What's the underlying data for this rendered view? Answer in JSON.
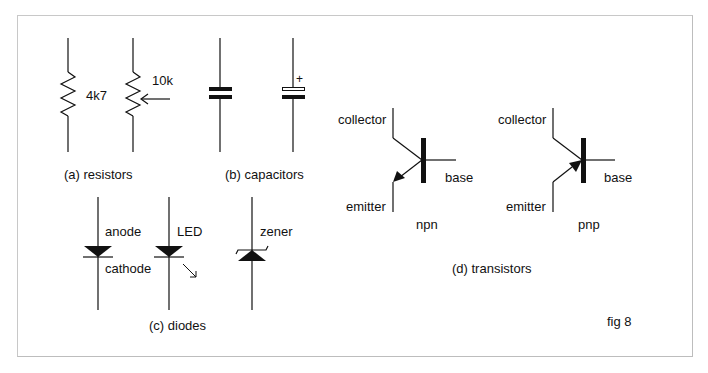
{
  "figure": {
    "label": "fig 8",
    "sections": {
      "resistors": {
        "caption": "(a) resistors",
        "fixed_value": "4k7",
        "variable_value": "10k"
      },
      "capacitors": {
        "caption": "(b) capacitors",
        "polarity_mark": "+"
      },
      "diodes": {
        "caption": "(c) diodes",
        "anode": "anode",
        "cathode": "cathode",
        "led": "LED",
        "zener": "zener"
      },
      "transistors": {
        "caption": "(d) transistors",
        "npn": {
          "type": "npn",
          "collector": "collector",
          "base": "base",
          "emitter": "emitter"
        },
        "pnp": {
          "type": "pnp",
          "collector": "collector",
          "base": "base",
          "emitter": "emitter"
        }
      }
    },
    "colors": {
      "ink": "#111111",
      "border": "#c8c8c8",
      "background": "#ffffff"
    }
  }
}
